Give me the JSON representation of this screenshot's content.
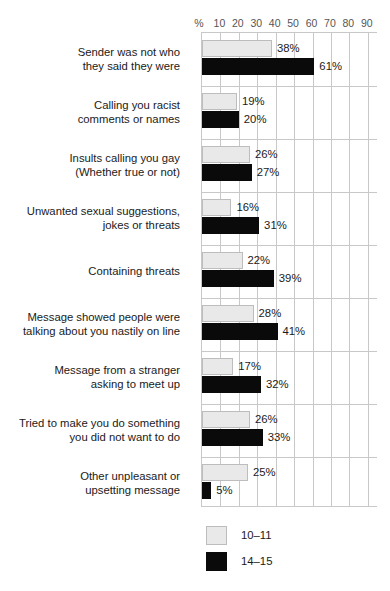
{
  "chart_data": {
    "type": "bar",
    "orientation": "horizontal",
    "title": "",
    "xlabel": "%",
    "ylabel": "",
    "xlim": [
      0,
      95
    ],
    "grid": true,
    "legend_position": "bottom-left",
    "axis_unit_label": "%",
    "tick_labels": [
      "10",
      "20",
      "30",
      "40",
      "50",
      "60",
      "70",
      "80",
      "90"
    ],
    "tick_values": [
      10,
      20,
      30,
      40,
      50,
      60,
      70,
      80,
      90
    ],
    "categories": [
      [
        "Sender was not who",
        "they said they were"
      ],
      [
        "Calling you racist",
        "comments or names"
      ],
      [
        "Insults calling you gay",
        "(Whether true or not)"
      ],
      [
        "Unwanted sexual suggestions,",
        "jokes or threats"
      ],
      [
        "Containing threats"
      ],
      [
        "Message showed people were",
        "talking about you nastily on line"
      ],
      [
        "Message from a stranger",
        "asking to meet up"
      ],
      [
        "Tried to make you do something",
        "you did not want to do"
      ],
      [
        "Other unpleasant or",
        "upsetting message"
      ]
    ],
    "series": [
      {
        "name": "10–11",
        "color": "#e9e9e9",
        "values": [
          38,
          19,
          26,
          16,
          22,
          28,
          17,
          26,
          25
        ],
        "labels": [
          "38%",
          "19%",
          "26%",
          "16%",
          "22%",
          "28%",
          "17%",
          "26%",
          "25%"
        ]
      },
      {
        "name": "14–15",
        "color": "#0a0a0a",
        "values": [
          61,
          20,
          27,
          31,
          39,
          41,
          32,
          33,
          5
        ],
        "labels": [
          "61%",
          "20%",
          "27%",
          "31%",
          "39%",
          "41%",
          "32%",
          "33%",
          "5%"
        ]
      }
    ]
  }
}
